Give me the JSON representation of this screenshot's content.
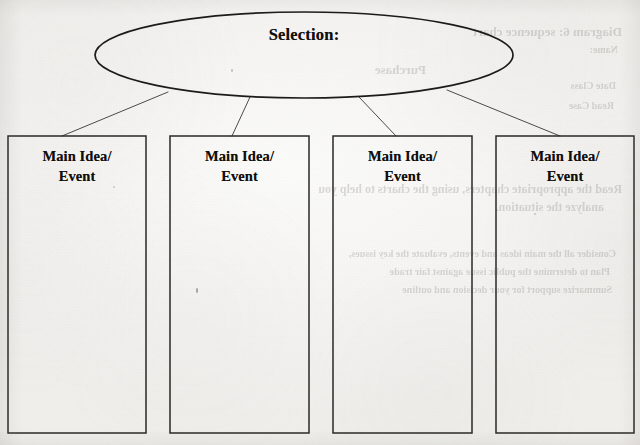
{
  "document": {
    "type": "graphic-organizer-worksheet",
    "medium": "scanned-paper",
    "paper_color": "#f5f4f2",
    "ink_color": "#100f0d"
  },
  "organizer": {
    "top_node": {
      "shape": "ellipse",
      "label": "Selection:",
      "x": 95,
      "y": 12,
      "width": 418,
      "height": 86
    },
    "boxes": [
      {
        "label_line1": "Main Idea/",
        "label_line2": "Event",
        "x": 8,
        "y": 136,
        "width": 138,
        "height": 297
      },
      {
        "label_line1": "Main Idea/",
        "label_line2": "Event",
        "x": 170,
        "y": 136,
        "width": 139,
        "height": 297
      },
      {
        "label_line1": "Main Idea/",
        "label_line2": "Event",
        "x": 333,
        "y": 136,
        "width": 139,
        "height": 297
      },
      {
        "label_line1": "Main Idea/",
        "label_line2": "Event",
        "x": 496,
        "y": 136,
        "width": 138,
        "height": 297
      }
    ],
    "connectors": [
      {
        "from_x": 168,
        "from_y": 92,
        "to_x": 62,
        "to_y": 136
      },
      {
        "from_x": 250,
        "from_y": 97,
        "to_x": 232,
        "to_y": 136
      },
      {
        "from_x": 359,
        "from_y": 97,
        "to_x": 396,
        "to_y": 136
      },
      {
        "from_x": 447,
        "from_y": 90,
        "to_x": 560,
        "to_y": 136
      }
    ]
  },
  "bleed_through": {
    "note": "faint mirrored show-through text from the reverse side of the page",
    "lines": [
      {
        "text": "Diagram 6: sequence chart",
        "x": 18,
        "y": 24,
        "size": 13
      },
      {
        "text": "Name:",
        "x": 22,
        "y": 44,
        "size": 10
      },
      {
        "text": "Purchase",
        "x": 214,
        "y": 62,
        "size": 13
      },
      {
        "text": "Date Class",
        "x": 24,
        "y": 80,
        "size": 10
      },
      {
        "text": "Read Case",
        "x": 26,
        "y": 100,
        "size": 10
      },
      {
        "text": "Read the appropriate chapters, using the charts to help you",
        "x": 18,
        "y": 182,
        "size": 12
      },
      {
        "text": "analyze the situation.",
        "x": 36,
        "y": 200,
        "size": 12
      },
      {
        "text": "Consider all the main ideas and events, evaluate the key issues,",
        "x": 24,
        "y": 248,
        "size": 10
      },
      {
        "text": "Plan to determine the public issue against fair trade",
        "x": 30,
        "y": 266,
        "size": 10
      },
      {
        "text": "Summarize support for your decision and outline",
        "x": 28,
        "y": 284,
        "size": 10
      }
    ]
  }
}
